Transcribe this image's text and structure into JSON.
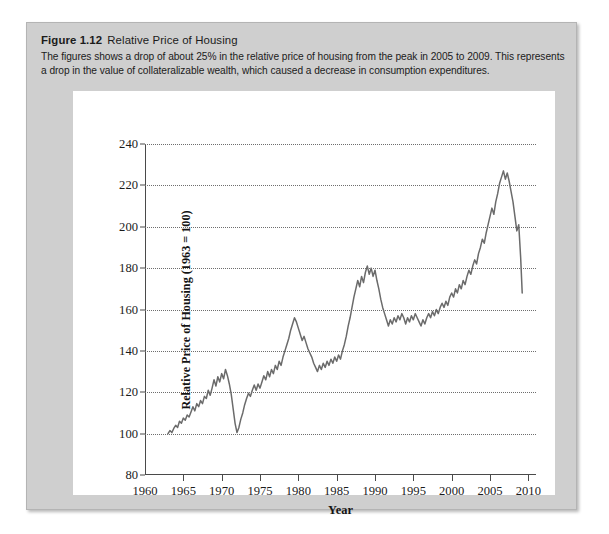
{
  "figure": {
    "label": "Figure 1.12",
    "name": "Relative Price of Housing",
    "description": "The figures shows a drop of about 25% in the relative price of housing from the peak in 2005 to 2009. This represents a drop in the value of collateralizable wealth, which caused a decrease in consumption expenditures."
  },
  "colors": {
    "panel_background": "#cfcfcf",
    "card_background": "#ffffff",
    "series_line": "#6b6b6b",
    "axis": "#4a4a4a",
    "gridline": "#6e6e6e",
    "text": "#1b1b1b"
  },
  "chart_data": {
    "type": "line",
    "title": "Relative Price of Housing",
    "xlabel": "Year",
    "ylabel": "Relative Price of Housing (1963 = 100)",
    "xlim": [
      1960,
      2011
    ],
    "ylim": [
      80,
      240
    ],
    "xticks": [
      1960,
      1965,
      1970,
      1975,
      1980,
      1985,
      1990,
      1995,
      2000,
      2005,
      2010
    ],
    "yticks": [
      80,
      100,
      120,
      140,
      160,
      180,
      200,
      220,
      240
    ],
    "grid": "horizontal-dotted",
    "legend": null,
    "series": [
      {
        "name": "Relative price of housing",
        "x": [
          1963.0,
          1963.25,
          1963.5,
          1963.75,
          1964.0,
          1964.25,
          1964.5,
          1964.75,
          1965.0,
          1965.25,
          1965.5,
          1965.75,
          1966.0,
          1966.25,
          1966.5,
          1966.75,
          1967.0,
          1967.25,
          1967.5,
          1967.75,
          1968.0,
          1968.25,
          1968.5,
          1968.75,
          1969.0,
          1969.25,
          1969.5,
          1969.75,
          1970.0,
          1970.25,
          1970.5,
          1970.75,
          1971.0,
          1971.25,
          1971.5,
          1971.75,
          1972.0,
          1972.25,
          1972.5,
          1972.75,
          1973.0,
          1973.25,
          1973.5,
          1973.75,
          1974.0,
          1974.25,
          1974.5,
          1974.75,
          1975.0,
          1975.25,
          1975.5,
          1975.75,
          1976.0,
          1976.25,
          1976.5,
          1976.75,
          1977.0,
          1977.25,
          1977.5,
          1977.75,
          1978.0,
          1978.25,
          1978.5,
          1978.75,
          1979.0,
          1979.25,
          1979.5,
          1979.75,
          1980.0,
          1980.25,
          1980.5,
          1980.75,
          1981.0,
          1981.25,
          1981.5,
          1981.75,
          1982.0,
          1982.25,
          1982.5,
          1982.75,
          1983.0,
          1983.25,
          1983.5,
          1983.75,
          1984.0,
          1984.25,
          1984.5,
          1984.75,
          1985.0,
          1985.25,
          1985.5,
          1985.75,
          1986.0,
          1986.25,
          1986.5,
          1986.75,
          1987.0,
          1987.25,
          1987.5,
          1987.75,
          1988.0,
          1988.25,
          1988.5,
          1988.75,
          1989.0,
          1989.25,
          1989.5,
          1989.75,
          1990.0,
          1990.25,
          1990.5,
          1990.75,
          1991.0,
          1991.25,
          1991.5,
          1991.75,
          1992.0,
          1992.25,
          1992.5,
          1992.75,
          1993.0,
          1993.25,
          1993.5,
          1993.75,
          1994.0,
          1994.25,
          1994.5,
          1994.75,
          1995.0,
          1995.25,
          1995.5,
          1995.75,
          1996.0,
          1996.25,
          1996.5,
          1996.75,
          1997.0,
          1997.25,
          1997.5,
          1997.75,
          1998.0,
          1998.25,
          1998.5,
          1998.75,
          1999.0,
          1999.25,
          1999.5,
          1999.75,
          2000.0,
          2000.25,
          2000.5,
          2000.75,
          2001.0,
          2001.25,
          2001.5,
          2001.75,
          2002.0,
          2002.25,
          2002.5,
          2002.75,
          2003.0,
          2003.25,
          2003.5,
          2003.75,
          2004.0,
          2004.25,
          2004.5,
          2004.75,
          2005.0,
          2005.25,
          2005.5,
          2005.75,
          2006.0,
          2006.25,
          2006.5,
          2006.75,
          2007.0,
          2007.25,
          2007.5,
          2007.75,
          2008.0,
          2008.25,
          2008.5,
          2008.75,
          2009.0,
          2009.2
        ],
        "y": [
          100.0,
          101.5,
          100.5,
          102.5,
          104.0,
          103.0,
          106.0,
          105.0,
          107.5,
          106.5,
          109.0,
          108.0,
          110.5,
          113.0,
          111.0,
          114.5,
          113.0,
          116.0,
          114.5,
          118.0,
          117.0,
          121.0,
          118.5,
          122.0,
          126.0,
          123.0,
          127.5,
          125.0,
          129.0,
          126.5,
          131.0,
          128.0,
          124.0,
          119.0,
          112.0,
          105.0,
          100.5,
          103.0,
          107.0,
          110.0,
          114.0,
          117.0,
          119.5,
          118.0,
          121.0,
          123.5,
          121.0,
          124.0,
          122.0,
          125.0,
          128.0,
          126.0,
          130.0,
          127.5,
          131.0,
          129.0,
          133.0,
          131.0,
          135.0,
          133.0,
          137.0,
          140.0,
          143.0,
          146.0,
          150.0,
          153.0,
          156.0,
          154.0,
          151.0,
          148.0,
          145.0,
          147.0,
          144.0,
          141.0,
          139.0,
          137.0,
          134.0,
          132.0,
          130.0,
          133.0,
          131.0,
          134.0,
          132.0,
          135.0,
          133.0,
          136.0,
          134.0,
          137.0,
          135.0,
          138.0,
          136.0,
          140.0,
          143.0,
          147.0,
          152.0,
          156.0,
          161.0,
          166.0,
          170.0,
          174.0,
          171.0,
          176.0,
          173.0,
          178.0,
          181.0,
          177.0,
          180.0,
          176.0,
          179.0,
          174.0,
          170.0,
          165.0,
          161.0,
          158.0,
          155.0,
          152.0,
          155.0,
          153.0,
          156.0,
          154.0,
          157.0,
          155.0,
          158.0,
          156.0,
          153.0,
          156.0,
          154.0,
          157.0,
          155.0,
          158.0,
          156.0,
          154.0,
          152.0,
          155.0,
          153.0,
          156.0,
          158.0,
          156.0,
          159.0,
          157.0,
          160.0,
          158.0,
          161.0,
          163.0,
          161.0,
          164.0,
          162.0,
          166.0,
          168.0,
          166.0,
          170.0,
          168.0,
          172.0,
          170.0,
          174.0,
          172.0,
          176.0,
          179.0,
          177.0,
          181.0,
          184.0,
          182.0,
          187.0,
          190.0,
          194.0,
          192.0,
          197.0,
          201.0,
          205.0,
          209.0,
          206.0,
          212.0,
          216.0,
          221.0,
          224.0,
          227.0,
          223.0,
          226.0,
          222.0,
          217.0,
          212.0,
          205.0,
          198.0,
          201.0,
          185.0,
          168.0
        ]
      }
    ],
    "annotations": []
  }
}
